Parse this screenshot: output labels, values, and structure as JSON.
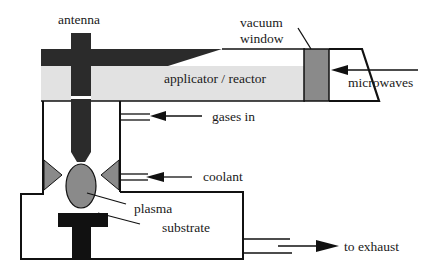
{
  "diagram": {
    "labels": {
      "antenna": "antenna",
      "vacuum_window_line1": "vacuum",
      "vacuum_window_line2": "window",
      "applicator": "applicator / reactor",
      "microwaves": "microwaves",
      "gases_in": "gases in",
      "coolant": "coolant",
      "plasma": "plasma",
      "substrate": "substrate",
      "exhaust": "to exhaust"
    },
    "colors": {
      "dark": "#2b2b2b",
      "mid_gray": "#8a8a8a",
      "light_gray": "#e2e2e2",
      "line": "#111111",
      "background": "#ffffff"
    }
  }
}
